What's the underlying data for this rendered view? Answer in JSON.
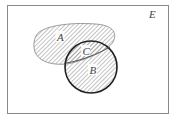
{
  "diagram": {
    "type": "venn",
    "universe_label": "E",
    "sets": [
      {
        "id": "A",
        "label": "A",
        "shape": "irregular-oval"
      },
      {
        "id": "B",
        "label": "B",
        "shape": "circle"
      }
    ],
    "regions": [
      {
        "id": "C",
        "label": "C",
        "description": "intersection of A and B"
      }
    ],
    "colors": {
      "frame": "#8a8a8a",
      "set_a_outline": "#9a9a9a",
      "set_b_outline": "#222222",
      "hatch": "#9a9a9a",
      "background": "#ffffff"
    }
  }
}
